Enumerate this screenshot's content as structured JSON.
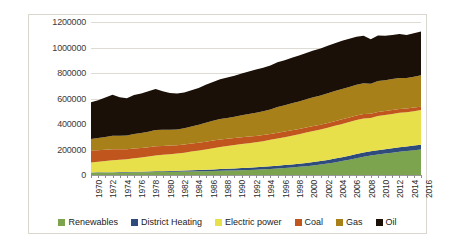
{
  "chart_data": {
    "type": "area",
    "stacked": true,
    "title": "",
    "xlabel": "",
    "ylabel": "",
    "ylim": [
      0,
      1200000
    ],
    "grid": true,
    "legend_position": "bottom",
    "y_ticks": [
      "0",
      "200000",
      "400000",
      "600000",
      "800000",
      "1000000",
      "1200000"
    ],
    "y_tick_values": [
      0,
      200000,
      400000,
      600000,
      800000,
      1000000,
      1200000
    ],
    "categories": [
      "1970",
      "1971",
      "1972",
      "1973",
      "1974",
      "1975",
      "1976",
      "1977",
      "1978",
      "1979",
      "1980",
      "1981",
      "1982",
      "1983",
      "1984",
      "1985",
      "1986",
      "1987",
      "1988",
      "1989",
      "1990",
      "1991",
      "1992",
      "1993",
      "1994",
      "1995",
      "1996",
      "1997",
      "1998",
      "1999",
      "2000",
      "2001",
      "2002",
      "2003",
      "2004",
      "2005",
      "2006",
      "2007",
      "2008",
      "2009",
      "2010",
      "2011",
      "2012",
      "2013",
      "2014",
      "2015",
      "2016"
    ],
    "x_tick_labels": [
      "1970",
      "1972",
      "1974",
      "1976",
      "1978",
      "1980",
      "1982",
      "1984",
      "1986",
      "1988",
      "1990",
      "1992",
      "1994",
      "1996",
      "1998",
      "2000",
      "2002",
      "2004",
      "2006",
      "2008",
      "2010",
      "2012",
      "2014",
      "2016"
    ],
    "series": [
      {
        "name": "Renewables",
        "color": "#7CA44E",
        "values": [
          18000,
          18500,
          19000,
          19500,
          20000,
          20500,
          21000,
          21500,
          22000,
          23000,
          24000,
          25000,
          26000,
          27000,
          28000,
          29000,
          30000,
          31500,
          33000,
          34500,
          36000,
          38000,
          40000,
          42000,
          45000,
          48000,
          51000,
          55000,
          59000,
          64000,
          69000,
          75000,
          82000,
          90000,
          99000,
          109000,
          120000,
          132000,
          143000,
          152000,
          160000,
          168000,
          175000,
          182000,
          188000,
          194000,
          200000
        ]
      },
      {
        "name": "District Heating",
        "color": "#2E4B7C",
        "values": [
          2000,
          2200,
          2500,
          2800,
          3200,
          3600,
          4000,
          4500,
          5000,
          5600,
          6200,
          7000,
          7800,
          8600,
          9500,
          10500,
          11500,
          12500,
          13500,
          14500,
          15500,
          16500,
          17500,
          18500,
          19500,
          20500,
          21500,
          22500,
          23500,
          24500,
          25500,
          26500,
          27500,
          28500,
          29500,
          30500,
          31500,
          32500,
          33000,
          33500,
          34000,
          34500,
          35000,
          35500,
          36000,
          36500,
          37000
        ]
      },
      {
        "name": "Electric power",
        "color": "#E8E04A",
        "values": [
          78000,
          83000,
          88000,
          94000,
          97000,
          100000,
          106000,
          112000,
          118000,
          124000,
          128000,
          131000,
          134000,
          139000,
          146000,
          152000,
          159000,
          166000,
          173000,
          178000,
          183000,
          188000,
          192000,
          196000,
          201000,
          207000,
          214000,
          219000,
          225000,
          231000,
          238000,
          243000,
          247000,
          252000,
          257000,
          261000,
          264000,
          267000,
          268000,
          262000,
          268000,
          268000,
          269000,
          270000,
          268000,
          270000,
          272000
        ]
      },
      {
        "name": "Coal",
        "color": "#C0561E",
        "values": [
          92000,
          90000,
          88000,
          86000,
          82000,
          78000,
          76000,
          74000,
          72000,
          72000,
          70000,
          68000,
          66000,
          64000,
          63000,
          62000,
          61000,
          60000,
          59000,
          58000,
          56000,
          54000,
          52000,
          50000,
          48000,
          46000,
          45000,
          44000,
          43000,
          41000,
          40000,
          39000,
          38000,
          38000,
          37000,
          36000,
          35000,
          35000,
          34000,
          32000,
          32000,
          31000,
          31000,
          30000,
          29000,
          28000,
          27000
        ]
      },
      {
        "name": "Gas",
        "color": "#A8801A",
        "values": [
          92000,
          96000,
          101000,
          106000,
          106000,
          108000,
          114000,
          118000,
          122000,
          128000,
          126000,
          124000,
          124000,
          128000,
          134000,
          141000,
          148000,
          155000,
          160000,
          162000,
          166000,
          172000,
          176000,
          182000,
          186000,
          192000,
          201000,
          206000,
          212000,
          216000,
          221000,
          226000,
          229000,
          233000,
          236000,
          238000,
          240000,
          242000,
          242000,
          236000,
          244000,
          242000,
          243000,
          244000,
          240000,
          243000,
          246000
        ]
      },
      {
        "name": "Oil",
        "color": "#1A1008",
        "values": [
          288000,
          296000,
          309000,
          322000,
          302000,
          292000,
          306000,
          310000,
          318000,
          322000,
          302000,
          288000,
          282000,
          281000,
          284000,
          288000,
          298000,
          304000,
          312000,
          318000,
          322000,
          328000,
          334000,
          338000,
          341000,
          346000,
          352000,
          354000,
          358000,
          360000,
          364000,
          366000,
          368000,
          372000,
          375000,
          378000,
          378000,
          376000,
          372000,
          350000,
          356000,
          348000,
          346000,
          344000,
          338000,
          340000,
          344000
        ]
      }
    ]
  },
  "legend": {
    "items": [
      {
        "label": "Renewables",
        "color": "#7CA44E"
      },
      {
        "label": "District Heating",
        "color": "#2E4B7C"
      },
      {
        "label": "Electric power",
        "color": "#E8E04A"
      },
      {
        "label": "Coal",
        "color": "#C0561E"
      },
      {
        "label": "Gas",
        "color": "#A8801A"
      },
      {
        "label": "Oil",
        "color": "#1A1008"
      }
    ]
  }
}
